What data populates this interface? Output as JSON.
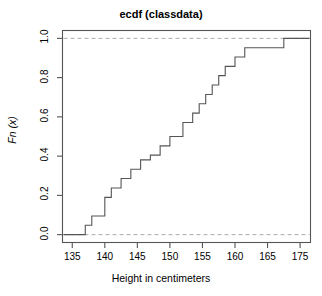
{
  "chart_data": {
    "type": "line",
    "subtype": "ecdf-step",
    "title": "ecdf (classdata)",
    "xlabel": "Height in centimeters",
    "ylabel": "Fn (x)",
    "xlim": [
      133.2,
      176.2
    ],
    "ylim": [
      -0.04,
      1.04
    ],
    "xticks": [
      135,
      140,
      145,
      150,
      155,
      160,
      165,
      175
    ],
    "xtick_labels": [
      "135",
      "140",
      "145",
      "150",
      "155",
      "160",
      "165",
      "175"
    ],
    "yticks": [
      0.0,
      0.2,
      0.4,
      0.6,
      0.8,
      1.0
    ],
    "ytick_labels": [
      "0.0",
      "0.2",
      "0.4",
      "0.6",
      "0.8",
      "1.0"
    ],
    "grid": false,
    "legend": null,
    "n_observations": 21,
    "x": [
      137.0,
      138.0,
      140.0,
      141.0,
      142.5,
      144.0,
      145.5,
      147.0,
      148.5,
      150.0,
      152.0,
      153.5,
      154.5,
      155.5,
      156.5,
      157.5,
      158.5,
      160.0,
      161.5,
      170.0
    ],
    "y": [
      0.048,
      0.095,
      0.19,
      0.238,
      0.286,
      0.333,
      0.381,
      0.405,
      0.452,
      0.5,
      0.571,
      0.619,
      0.667,
      0.714,
      0.762,
      0.81,
      0.857,
      0.905,
      0.952,
      1.0
    ],
    "reference_lines": [
      {
        "y": 0.0,
        "style": "dashed",
        "color": "#999999"
      },
      {
        "y": 1.0,
        "style": "dashed",
        "color": "#999999"
      }
    ],
    "line_color": "#555555",
    "frame_color": "#555555"
  },
  "colors": {
    "background": "#ffffff",
    "axis": "#555555",
    "step_line": "#555555",
    "gridline": "#aaaaaa",
    "text": "#000000"
  }
}
